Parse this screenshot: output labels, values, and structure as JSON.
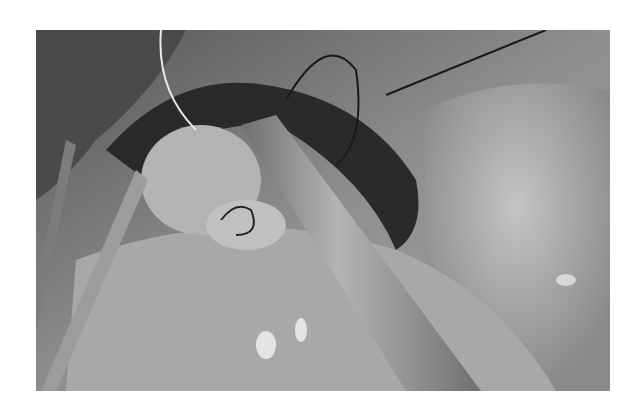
{
  "figure": {
    "colors": {
      "background": "#ffffff",
      "tissue_light": "#b8b8b8",
      "tissue_mid": "#8c8c8c",
      "tissue_dark": "#2a2a2a",
      "instrument": "#9a9a9a",
      "highlight": "#f2f2f2"
    }
  }
}
